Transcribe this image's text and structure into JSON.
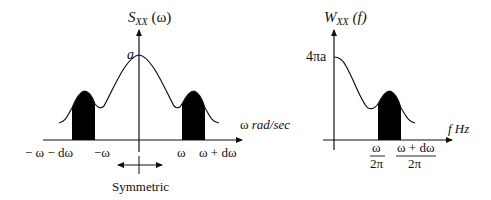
{
  "left_plot": {
    "y_axis_label": {
      "main": "S",
      "sub": "XX",
      "arg": " (ω)"
    },
    "x_axis_label": {
      "symbol": "ω",
      "unit": " rad/sec"
    },
    "peak_label": "a",
    "tick_labels": [
      "− ω − dω",
      "−ω",
      "ω",
      "ω + dω"
    ],
    "symmetry_label": "Symmetric"
  },
  "right_plot": {
    "y_axis_label": {
      "main": "W",
      "sub": "XX",
      "arg": " (f)"
    },
    "x_axis_label": "f Hz",
    "peak_label": "4πa",
    "tick_labels": [
      {
        "num": "ω",
        "den": "2π"
      },
      {
        "num": "ω + dω",
        "den": "2π"
      }
    ]
  },
  "colors": {
    "stroke": "#111111",
    "fill": "#000000",
    "background": "#ffffff"
  }
}
